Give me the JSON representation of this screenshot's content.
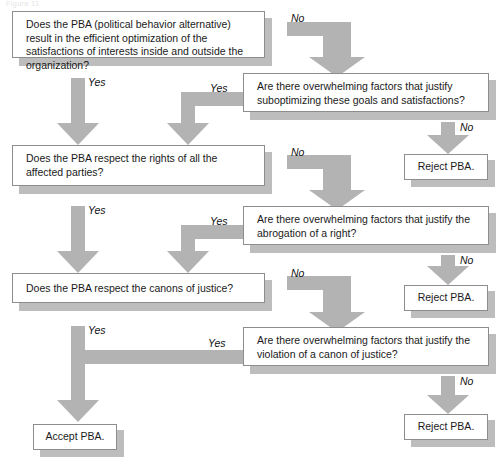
{
  "figure": {
    "caption_fragment": "Figure 11",
    "palette": {
      "arrow": "#b3b3b3",
      "shadow": "#bdbdbd",
      "box_border": "#8d8d8d",
      "box_fill": "#ffffff",
      "text": "#1a1a1a"
    }
  },
  "nodes": [
    {
      "id": "q1",
      "kind": "decision",
      "text": "Does the PBA (political behavior alternative) result in the efficient optimization of the satisfactions of interests inside and outside the organization?"
    },
    {
      "id": "q2",
      "kind": "decision",
      "text": "Are there overwhelming factors that justify suboptimizing these goals and satisfactions?"
    },
    {
      "id": "q3",
      "kind": "decision",
      "text": "Does the PBA respect the rights of all the affected parties?"
    },
    {
      "id": "q4",
      "kind": "decision",
      "text": "Are there overwhelming factors that justify the abrogation of a right?"
    },
    {
      "id": "q5",
      "kind": "decision",
      "text": "Does the PBA respect the canons of justice?"
    },
    {
      "id": "q6",
      "kind": "decision",
      "text": "Are there overwhelming factors that justify the violation of a canon of justice?"
    },
    {
      "id": "r1",
      "kind": "terminal",
      "text": "Reject PBA."
    },
    {
      "id": "r2",
      "kind": "terminal",
      "text": "Reject PBA."
    },
    {
      "id": "r3",
      "kind": "terminal",
      "text": "Reject PBA."
    },
    {
      "id": "accept",
      "kind": "terminal",
      "text": "Accept PBA."
    }
  ],
  "edge_labels": [
    {
      "id": "e1",
      "text": "No"
    },
    {
      "id": "e2",
      "text": "Yes"
    },
    {
      "id": "e3",
      "text": "Yes"
    },
    {
      "id": "e4",
      "text": "No"
    },
    {
      "id": "e5",
      "text": "No"
    },
    {
      "id": "e6",
      "text": "Yes"
    },
    {
      "id": "e7",
      "text": "Yes"
    },
    {
      "id": "e8",
      "text": "No"
    },
    {
      "id": "e9",
      "text": "No"
    },
    {
      "id": "e10",
      "text": "Yes"
    },
    {
      "id": "e11",
      "text": "Yes"
    },
    {
      "id": "e12",
      "text": "No"
    }
  ]
}
